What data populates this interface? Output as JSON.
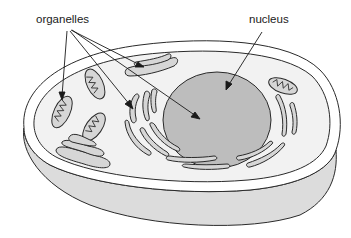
{
  "diagram": {
    "labels": {
      "organelles": "organelles",
      "nucleus": "nucleus"
    },
    "colors": {
      "background": "#ffffff",
      "cytoplasm": "#f2f2f2",
      "cell_side": "#dcdcdc",
      "nucleus": "#bdbdbd",
      "organelle": "#d6d6d6",
      "stroke": "#2a2a2a"
    }
  }
}
